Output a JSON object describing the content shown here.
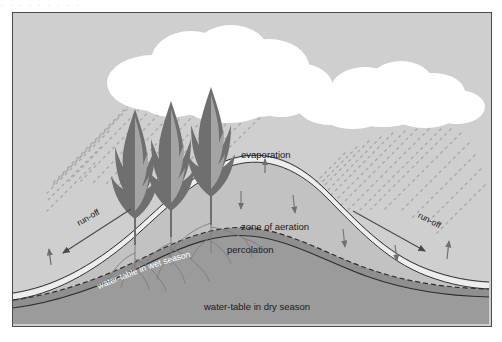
{
  "page": {
    "ghost_text": "· ·  ·     ·            ·     ·      ·       ·        ·",
    "background": "#ffffff",
    "frame_border": "#4c4c4c"
  },
  "diagram": {
    "sky_color": "#cfcfcf",
    "cloud_color": "#ffffff",
    "rain_color": "#a8a8a8",
    "soil_surface_color": "#efefef",
    "aeration_zone_color": "#c2c2c2",
    "saturated_band_color": "#8f8f8f",
    "deep_ground_color": "#9b9b9b",
    "outline_color": "#3a3a3a",
    "tree_foliage_dark": "#6e6e6e",
    "tree_foliage_light": "#a6a6a6",
    "root_color": "#7a7a7a",
    "arrow_color": "#7a7a7a",
    "labels": {
      "evaporation": "evaporation",
      "zone_of_aeration": "zone of aeration",
      "percolation": "percolation",
      "water_table_wet": "water-table in wet season",
      "water_table_dry": "water-table in dry season",
      "runoff_left": "run-off",
      "runoff_right": "run-off"
    },
    "features": {
      "cloud_left": "cumulus-cloud",
      "cloud_right": "cumulus-cloud",
      "rain_left": "rainfall-streaks",
      "rain_right": "rainfall-streaks",
      "trees": 3,
      "percolation_arrows": 4,
      "evaporation_arrows": 3,
      "runoff_arrows": 2
    }
  }
}
